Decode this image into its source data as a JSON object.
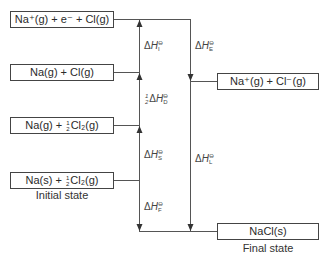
{
  "diagram": {
    "type": "born-haber-cycle",
    "levels": [
      {
        "id": "ionised-gas-electron",
        "label": "Na⁺(g) + e⁻ + Cl(g)"
      },
      {
        "id": "atoms-gas",
        "label": "Na(g) + Cl(g)"
      },
      {
        "id": "na-gas-half-cl2",
        "label_pre": "Na(g) + ",
        "frac_num": "1",
        "frac_den": "2",
        "label_post": "Cl₂(g)"
      },
      {
        "id": "initial-state",
        "label_pre": "Na(s) + ",
        "frac_num": "1",
        "frac_den": "2",
        "label_post": "Cl₂(g)",
        "caption": "Initial state"
      },
      {
        "id": "ions-gas",
        "label": "Na⁺(g) + Cl⁻(g)"
      },
      {
        "id": "final-state",
        "label": "NaCl(s)",
        "caption": "Final state"
      }
    ],
    "enthalpy_labels": [
      {
        "id": "ionisation",
        "prefix": "",
        "delta": "Δ",
        "H": "H",
        "sup": "⊖",
        "sub": "I"
      },
      {
        "id": "dissociation",
        "prefix_num": "1",
        "prefix_den": "2",
        "delta": "Δ",
        "H": "H",
        "sup": "⊖",
        "sub": "D"
      },
      {
        "id": "sublimation",
        "delta": "Δ",
        "H": "H",
        "sup": "⊖",
        "sub": "S"
      },
      {
        "id": "formation",
        "delta": "Δ",
        "H": "H",
        "sup": "⊖",
        "sub": "F"
      },
      {
        "id": "electron-affinity",
        "delta": "Δ",
        "H": "H",
        "sup": "⊖",
        "sub": "E"
      },
      {
        "id": "lattice",
        "delta": "Δ",
        "H": "H",
        "sup": "⊖",
        "sub": "L"
      }
    ],
    "colors": {
      "line": "#444444",
      "text": "#2a2a2a",
      "background": "#ffffff"
    }
  }
}
